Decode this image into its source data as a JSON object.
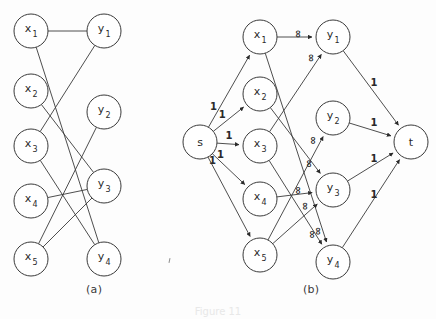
{
  "figure": {
    "caption": "Figure 11",
    "panels": [
      {
        "id": "a",
        "label": "(a)",
        "type": "bipartite-graph"
      },
      {
        "id": "b",
        "label": "(b)",
        "type": "flow-network"
      }
    ]
  },
  "panel_a": {
    "label": "(a)",
    "left_nodes": [
      {
        "id": "x1",
        "base": "x",
        "sub": "1",
        "cx": 31,
        "cy": 31
      },
      {
        "id": "x2",
        "base": "x",
        "sub": "2",
        "cx": 31,
        "cy": 91
      },
      {
        "id": "x3",
        "base": "x",
        "sub": "3",
        "cx": 31,
        "cy": 146
      },
      {
        "id": "x4",
        "base": "x",
        "sub": "4",
        "cx": 31,
        "cy": 201
      },
      {
        "id": "x5",
        "base": "x",
        "sub": "5",
        "cx": 31,
        "cy": 259
      }
    ],
    "right_nodes": [
      {
        "id": "y1",
        "base": "y",
        "sub": "1",
        "cx": 104,
        "cy": 31
      },
      {
        "id": "y2",
        "base": "y",
        "sub": "2",
        "cx": 104,
        "cy": 112
      },
      {
        "id": "y3",
        "base": "y",
        "sub": "3",
        "cx": 104,
        "cy": 186
      },
      {
        "id": "y4",
        "base": "y",
        "sub": "4",
        "cx": 104,
        "cy": 259
      }
    ],
    "edges": [
      {
        "from": "x1",
        "to": "y1"
      },
      {
        "from": "x1",
        "to": "y4"
      },
      {
        "from": "x2",
        "to": "y3"
      },
      {
        "from": "x3",
        "to": "y1"
      },
      {
        "from": "x3",
        "to": "y4"
      },
      {
        "from": "x4",
        "to": "y3"
      },
      {
        "from": "x5",
        "to": "y2"
      },
      {
        "from": "x5",
        "to": "y3"
      }
    ]
  },
  "panel_b": {
    "label": "(b)",
    "source": {
      "id": "s",
      "base": "s",
      "sub": "",
      "cx": 200,
      "cy": 142
    },
    "sink": {
      "id": "t",
      "base": "t",
      "sub": "",
      "cx": 411,
      "cy": 142
    },
    "left_nodes": [
      {
        "id": "x1",
        "base": "x",
        "sub": "1",
        "cx": 260,
        "cy": 37
      },
      {
        "id": "x2",
        "base": "x",
        "sub": "2",
        "cx": 260,
        "cy": 94
      },
      {
        "id": "x3",
        "base": "x",
        "sub": "3",
        "cx": 260,
        "cy": 146
      },
      {
        "id": "x4",
        "base": "x",
        "sub": "4",
        "cx": 260,
        "cy": 199
      },
      {
        "id": "x5",
        "base": "x",
        "sub": "5",
        "cx": 260,
        "cy": 255
      }
    ],
    "right_nodes": [
      {
        "id": "y1",
        "base": "y",
        "sub": "1",
        "cx": 333,
        "cy": 37
      },
      {
        "id": "y2",
        "base": "y",
        "sub": "2",
        "cx": 333,
        "cy": 118
      },
      {
        "id": "y3",
        "base": "y",
        "sub": "3",
        "cx": 333,
        "cy": 190
      },
      {
        "id": "y4",
        "base": "y",
        "sub": "4",
        "cx": 333,
        "cy": 262
      }
    ],
    "source_edges": [
      {
        "from": "s",
        "to": "x1",
        "capacity": "1"
      },
      {
        "from": "s",
        "to": "x2",
        "capacity": "1"
      },
      {
        "from": "s",
        "to": "x3",
        "capacity": "1"
      },
      {
        "from": "s",
        "to": "x4",
        "capacity": "1"
      },
      {
        "from": "s",
        "to": "x5",
        "capacity": "1"
      }
    ],
    "middle_edges": [
      {
        "from": "x1",
        "to": "y1",
        "capacity": "∞"
      },
      {
        "from": "x1",
        "to": "y4",
        "capacity": "∞"
      },
      {
        "from": "x2",
        "to": "y3",
        "capacity": "∞"
      },
      {
        "from": "x3",
        "to": "y1",
        "capacity": "∞"
      },
      {
        "from": "x3",
        "to": "y4",
        "capacity": "∞"
      },
      {
        "from": "x4",
        "to": "y3",
        "capacity": "∞"
      },
      {
        "from": "x5",
        "to": "y2",
        "capacity": "∞"
      },
      {
        "from": "x5",
        "to": "y3",
        "capacity": "∞"
      }
    ],
    "sink_edges": [
      {
        "from": "y1",
        "to": "t",
        "capacity": "1"
      },
      {
        "from": "y2",
        "to": "t",
        "capacity": "1"
      },
      {
        "from": "y3",
        "to": "t",
        "capacity": "1"
      },
      {
        "from": "y4",
        "to": "t",
        "capacity": "1"
      }
    ]
  },
  "style": {
    "stroke": "#3a3a3a",
    "node_fill": "#ffffff",
    "radius": 17
  }
}
